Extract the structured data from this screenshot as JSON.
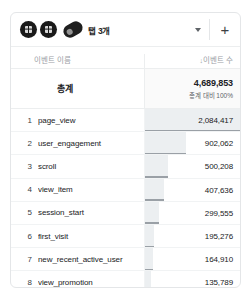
{
  "toolbar": {
    "icons": [
      {
        "name": "segment-chip-1",
        "glyph": "segment-icon"
      },
      {
        "name": "segment-chip-2",
        "glyph": "segment-icon"
      },
      {
        "name": "tab-chip",
        "glyph": "tab-pill-icon"
      }
    ],
    "tab_label": "탭 3개",
    "caret_label": "▾",
    "plus_label": "+"
  },
  "table": {
    "headers": {
      "name": "이벤트 이름",
      "value": "이벤트 수",
      "sort_arrow": "↓"
    },
    "totals": {
      "label": "총계",
      "value": "4,689,853",
      "subtext": "총계 대비 100%"
    },
    "rows": [
      {
        "index": "1",
        "name": "page_view",
        "value": "2,084,417"
      },
      {
        "index": "2",
        "name": "user_engagement",
        "value": "902,062"
      },
      {
        "index": "3",
        "name": "scroll",
        "value": "500,208"
      },
      {
        "index": "4",
        "name": "view_item",
        "value": "407,636"
      },
      {
        "index": "5",
        "name": "session_start",
        "value": "299,555"
      },
      {
        "index": "6",
        "name": "first_visit",
        "value": "195,276"
      },
      {
        "index": "7",
        "name": "new_recent_active_user",
        "value": "164,910"
      },
      {
        "index": "8",
        "name": "view_promotion",
        "value": "135,789"
      }
    ]
  },
  "chart_data": {
    "type": "bar",
    "title": "이벤트 수",
    "xlabel": "",
    "ylabel": "이벤트 이름",
    "categories": [
      "page_view",
      "user_engagement",
      "scroll",
      "view_item",
      "session_start",
      "first_visit",
      "new_recent_active_user",
      "view_promotion"
    ],
    "values": [
      2084417,
      902062,
      500208,
      407636,
      299555,
      195276,
      164910,
      135789
    ],
    "total": 4689853,
    "total_share": "100%",
    "max": 2084417,
    "orientation": "horizontal",
    "grid": false,
    "legend": "none",
    "bar_color": "#eceff1"
  },
  "colors": {
    "card_border": "#e4e6e8",
    "bar_fill": "#eceff1",
    "bar_cap": "#9aa0a6",
    "text_primary": "#202124",
    "text_muted": "#9aa0a6",
    "chip_dark": "#1a1a1a"
  }
}
